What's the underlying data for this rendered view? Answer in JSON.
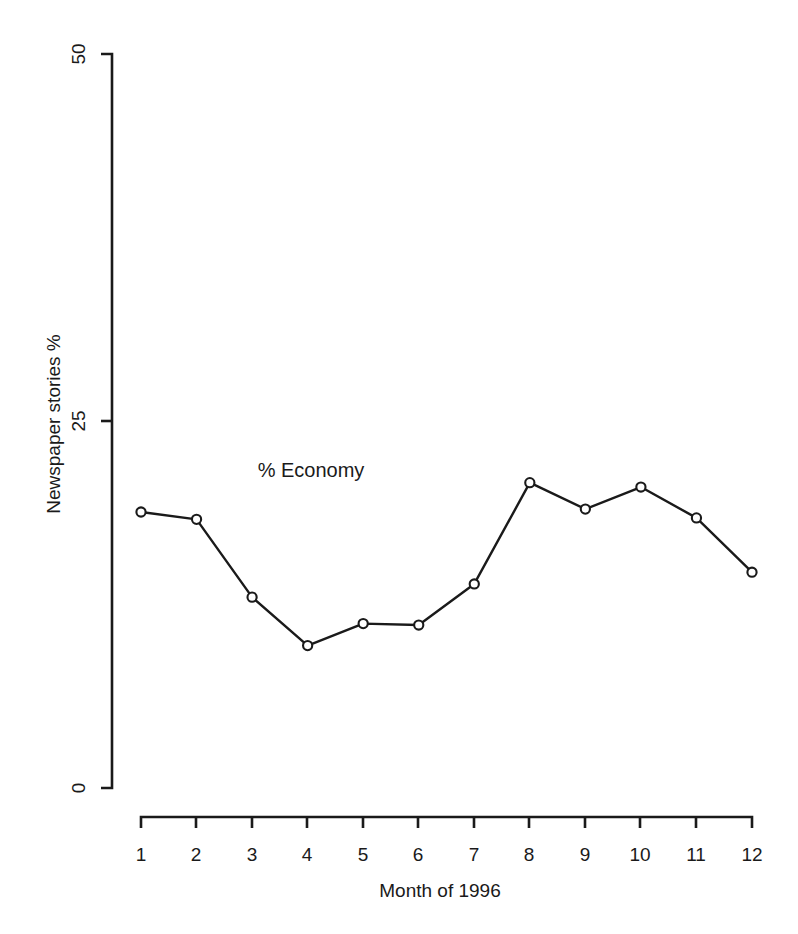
{
  "chart_data": {
    "type": "line",
    "title": "",
    "subtitle": "",
    "xlabel": "Month of 1996",
    "ylabel": "Newspaper stories %",
    "x": [
      1,
      2,
      3,
      4,
      5,
      6,
      7,
      8,
      9,
      10,
      11,
      12
    ],
    "categories": [
      "1",
      "2",
      "3",
      "4",
      "5",
      "6",
      "7",
      "8",
      "9",
      "10",
      "11",
      "12"
    ],
    "series": [
      {
        "name": "% Economy",
        "values": [
          18.8,
          18.3,
          13.0,
          9.7,
          11.2,
          11.1,
          13.9,
          20.8,
          19.0,
          20.5,
          18.4,
          14.7
        ]
      }
    ],
    "annotations": [
      {
        "text": "% Economy",
        "x": 3.1,
        "y": 21.2
      }
    ],
    "xlim": [
      1,
      12
    ],
    "ylim": [
      0,
      50
    ],
    "xticks": [
      1,
      2,
      3,
      4,
      5,
      6,
      7,
      8,
      9,
      10,
      11,
      12
    ],
    "xtick_labels": [
      "1",
      "2",
      "3",
      "4",
      "5",
      "6",
      "7",
      "8",
      "9",
      "10",
      "11",
      "12"
    ],
    "yticks": [
      0,
      25,
      50
    ],
    "ytick_labels": [
      "0",
      "25",
      "50"
    ],
    "grid": false,
    "legend": "none",
    "marker": "open-circle",
    "line_color": "#1a1a1a",
    "marker_fill": "#ffffff",
    "marker_stroke": "#1a1a1a",
    "background": "#ffffff"
  },
  "axis": {
    "y_tick_0": "0",
    "y_tick_25": "25",
    "y_tick_50": "50",
    "x_tick_1": "1",
    "x_tick_2": "2",
    "x_tick_3": "3",
    "x_tick_4": "4",
    "x_tick_5": "5",
    "x_tick_6": "6",
    "x_tick_7": "7",
    "x_tick_8": "8",
    "x_tick_9": "9",
    "x_tick_10": "10",
    "x_tick_11": "11",
    "x_tick_12": "12",
    "x_title": "Month of 1996",
    "y_title": "Newspaper stories %"
  },
  "annotation": {
    "economy_label": "% Economy"
  }
}
